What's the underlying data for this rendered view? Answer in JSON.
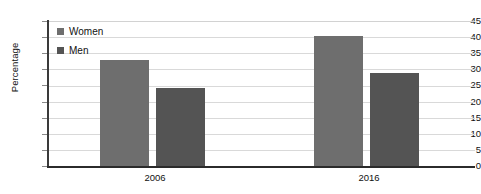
{
  "chart_data": {
    "type": "bar",
    "title": "",
    "xlabel": "",
    "ylabel": "Percentage",
    "categories": [
      "2006",
      "2016"
    ],
    "series": [
      {
        "name": "Women",
        "values": [
          33,
          40.5
        ],
        "color": "#6e6e6e"
      },
      {
        "name": "Men",
        "values": [
          24.5,
          29
        ],
        "color": "#545454"
      }
    ],
    "ylim": [
      0,
      45
    ],
    "ytick_step": 5,
    "yticks": [
      "45",
      "40",
      "35",
      "30",
      "25",
      "20",
      "15",
      "10",
      "5",
      "0"
    ],
    "grid": true,
    "legend_position": "top-left"
  },
  "legend": {
    "items": [
      {
        "label": "Women"
      },
      {
        "label": "Men"
      }
    ]
  }
}
